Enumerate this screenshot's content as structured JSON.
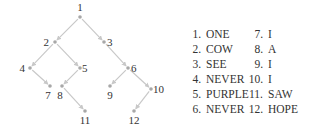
{
  "diagram": {
    "type": "tree",
    "edge_color": "#c8c8c8",
    "node_color": "#a8a8a8",
    "nodes": [
      {
        "id": "1",
        "x": 80,
        "y": 17,
        "label": "1",
        "lx": 80,
        "ly": 11,
        "anchor": "middle"
      },
      {
        "id": "2",
        "x": 55,
        "y": 42,
        "label": "2",
        "lx": 49,
        "ly": 46,
        "anchor": "end"
      },
      {
        "id": "3",
        "x": 104,
        "y": 42,
        "label": "3",
        "lx": 107,
        "ly": 46,
        "anchor": "start"
      },
      {
        "id": "4",
        "x": 30,
        "y": 68,
        "label": "4",
        "lx": 25,
        "ly": 72,
        "anchor": "end"
      },
      {
        "id": "5",
        "x": 80,
        "y": 68,
        "label": "5",
        "lx": 82,
        "ly": 72,
        "anchor": "start"
      },
      {
        "id": "6",
        "x": 128,
        "y": 68,
        "label": "6",
        "lx": 131,
        "ly": 72,
        "anchor": "start"
      },
      {
        "id": "7",
        "x": 50,
        "y": 86,
        "label": "7",
        "lx": 48,
        "ly": 99,
        "anchor": "middle"
      },
      {
        "id": "8",
        "x": 62,
        "y": 86,
        "label": "8",
        "lx": 60,
        "ly": 99,
        "anchor": "middle"
      },
      {
        "id": "9",
        "x": 110,
        "y": 86,
        "label": "9",
        "lx": 110,
        "ly": 99,
        "anchor": "middle"
      },
      {
        "id": "10",
        "x": 151,
        "y": 89,
        "label": "10",
        "lx": 153,
        "ly": 93,
        "anchor": "start"
      },
      {
        "id": "11",
        "x": 85,
        "y": 111,
        "label": "11",
        "lx": 85,
        "ly": 124,
        "anchor": "middle"
      },
      {
        "id": "12",
        "x": 134,
        "y": 111,
        "label": "12",
        "lx": 134,
        "ly": 124,
        "anchor": "middle"
      }
    ],
    "edges": [
      [
        "1",
        "2"
      ],
      [
        "1",
        "3"
      ],
      [
        "2",
        "4"
      ],
      [
        "2",
        "5"
      ],
      [
        "3",
        "6"
      ],
      [
        "4",
        "7"
      ],
      [
        "5",
        "8"
      ],
      [
        "6",
        "9"
      ],
      [
        "6",
        "10"
      ],
      [
        "8",
        "11"
      ],
      [
        "10",
        "12"
      ]
    ]
  },
  "legend": {
    "columns": [
      [
        {
          "num": "1.",
          "word": "ONE"
        },
        {
          "num": "2.",
          "word": "COW"
        },
        {
          "num": "3.",
          "word": "SEE"
        },
        {
          "num": "4.",
          "word": "NEVER"
        },
        {
          "num": "5.",
          "word": "PURPLE"
        },
        {
          "num": "6.",
          "word": "NEVER"
        }
      ],
      [
        {
          "num": "7.",
          "word": "I"
        },
        {
          "num": "8.",
          "word": "A"
        },
        {
          "num": "9.",
          "word": "I"
        },
        {
          "num": "10.",
          "word": "I"
        },
        {
          "num": "11.",
          "word": "SAW"
        },
        {
          "num": "12.",
          "word": "HOPE"
        }
      ]
    ]
  }
}
